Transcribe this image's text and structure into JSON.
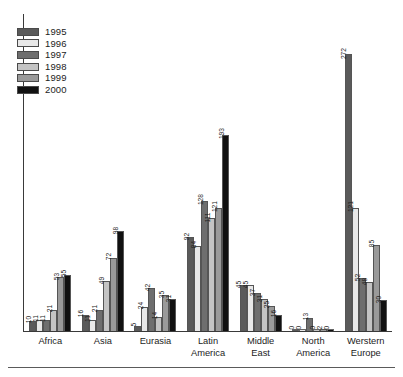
{
  "chart_data": {
    "type": "bar",
    "title": "",
    "subtitle": "",
    "xlabel": "",
    "ylabel": "",
    "ylim": [
      0,
      290
    ],
    "grid": false,
    "legend_position": "top-left",
    "orientation": "vertical",
    "value_labels_rotated": true,
    "categories": [
      "Africa",
      "Asia",
      "Eurasia",
      "Latin\nAmerica",
      "Middle\nEast",
      "North\nAmerica",
      "Werstern\nEurope"
    ],
    "series": [
      {
        "name": "1995",
        "color": "#5a5a5a",
        "values": [
          10,
          16,
          5,
          92,
          45,
          0,
          272
        ]
      },
      {
        "name": "1996",
        "color": "#e8e8e8",
        "values": [
          11,
          11,
          24,
          84,
          45,
          0,
          121
        ]
      },
      {
        "name": "1997",
        "color": "#6e6e6e",
        "values": [
          11,
          21,
          42,
          128,
          37,
          13,
          52
        ]
      },
      {
        "name": "1998",
        "color": "#c4c4c4",
        "values": [
          21,
          49,
          14,
          111,
          31,
          0,
          48
        ]
      },
      {
        "name": "1999",
        "color": "#9a9a9a",
        "values": [
          53,
          72,
          35,
          121,
          25,
          2,
          85
        ]
      },
      {
        "name": "2000",
        "color": "#111111",
        "values": [
          55,
          98,
          31,
          193,
          16,
          0,
          30
        ]
      }
    ]
  },
  "legend": {
    "items": [
      {
        "label": "1995",
        "color": "#5a5a5a"
      },
      {
        "label": "1996",
        "color": "#e8e8e8"
      },
      {
        "label": "1997",
        "color": "#6e6e6e"
      },
      {
        "label": "1998",
        "color": "#c4c4c4"
      },
      {
        "label": "1999",
        "color": "#9a9a9a"
      },
      {
        "label": "2000",
        "color": "#111111"
      }
    ]
  }
}
